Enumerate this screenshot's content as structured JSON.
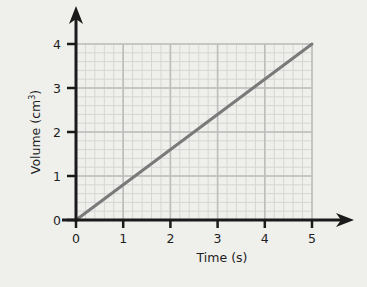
{
  "chart_data": {
    "type": "line",
    "title": "",
    "xlabel": "Time (s)",
    "ylabel": "Volume (cm³)",
    "ylabel_base": "Volume (cm",
    "ylabel_sup": "3",
    "ylabel_close": ")",
    "xlim": [
      0,
      5
    ],
    "ylim": [
      0,
      4
    ],
    "x_ticks": [
      "0",
      "1",
      "2",
      "3",
      "4",
      "5"
    ],
    "y_ticks": [
      "0",
      "1",
      "2",
      "3",
      "4"
    ],
    "grid": true,
    "grid_minor_divisions": 5,
    "legend": null,
    "series": [
      {
        "name": "Volume",
        "x": [
          0,
          5
        ],
        "y": [
          0,
          4
        ],
        "color": "#7a7a7a"
      }
    ]
  },
  "colors": {
    "background": "#efefec",
    "axis": "#1a1a1a",
    "grid_major": "#bdbdbd",
    "grid_minor": "#d6d6d6",
    "line": "#7a7a7a"
  }
}
